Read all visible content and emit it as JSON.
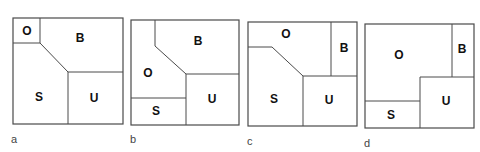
{
  "figure": {
    "panels": [
      {
        "id": "a",
        "caption": "a",
        "regions": [
          {
            "label": "O"
          },
          {
            "label": "B"
          },
          {
            "label": "S"
          },
          {
            "label": "U"
          }
        ]
      },
      {
        "id": "b",
        "caption": "b",
        "regions": [
          {
            "label": "B"
          },
          {
            "label": "O"
          },
          {
            "label": "U"
          },
          {
            "label": "S"
          }
        ]
      },
      {
        "id": "c",
        "caption": "c",
        "regions": [
          {
            "label": "O"
          },
          {
            "label": "B"
          },
          {
            "label": "S"
          },
          {
            "label": "U"
          }
        ]
      },
      {
        "id": "d",
        "caption": "d",
        "regions": [
          {
            "label": "O"
          },
          {
            "label": "B"
          },
          {
            "label": "U"
          },
          {
            "label": "S"
          }
        ]
      }
    ]
  }
}
